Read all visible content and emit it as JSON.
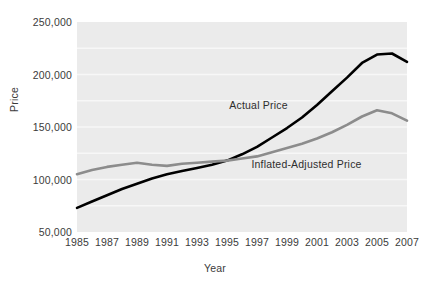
{
  "chart_data": {
    "type": "line",
    "title": "",
    "xlabel": "Year",
    "ylabel": "Price",
    "grid": "horizontal",
    "legend_position": "inline-annotations",
    "plot_background": "#ebebeb",
    "x": [
      1985,
      1986,
      1987,
      1988,
      1989,
      1990,
      1991,
      1992,
      1993,
      1994,
      1995,
      1996,
      1997,
      1998,
      1999,
      2000,
      2001,
      2002,
      2003,
      2004,
      2005,
      2006,
      2007
    ],
    "xlim": [
      1985,
      2007
    ],
    "ylim": [
      50000,
      250000
    ],
    "x_tick_labels": [
      "1985",
      "1987",
      "1989",
      "1991",
      "1993",
      "1995",
      "1997",
      "1999",
      "2001",
      "2003",
      "2005",
      "2007"
    ],
    "x_tick_values": [
      1985,
      1987,
      1989,
      1991,
      1993,
      1995,
      1997,
      1999,
      2001,
      2003,
      2005,
      2007
    ],
    "y_tick_labels": [
      "250,000",
      "200,000",
      "150,000",
      "100,000",
      "50,000"
    ],
    "y_tick_values": [
      250000,
      200000,
      150000,
      100000,
      50000
    ],
    "series": [
      {
        "name": "Actual Price",
        "color": "#000000",
        "width": 2.6,
        "label_x": 1997.1,
        "label_y": 171000,
        "values": [
          73000,
          79000,
          85000,
          91000,
          96000,
          101000,
          105000,
          108000,
          111000,
          114000,
          118000,
          124000,
          131000,
          140000,
          149000,
          159000,
          171000,
          184000,
          197000,
          211000,
          219000,
          220000,
          212000
        ]
      },
      {
        "name": "Inflated-Adjusted Price",
        "color": "#8c8c8c",
        "width": 2.6,
        "label_x": 2000.3,
        "label_y": 115000,
        "values": [
          105000,
          109000,
          112000,
          114000,
          116000,
          114000,
          113000,
          115000,
          116000,
          117000,
          118000,
          120000,
          122000,
          126000,
          130000,
          134000,
          139000,
          145000,
          152000,
          160000,
          166000,
          163000,
          156000
        ]
      }
    ]
  }
}
